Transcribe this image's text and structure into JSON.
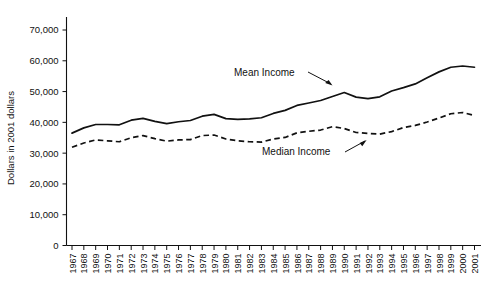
{
  "chart_data": {
    "type": "line",
    "title": "",
    "xlabel": "",
    "ylabel": "Dollars in 2001 dollars",
    "ylim": [
      0,
      75000
    ],
    "yticks": [
      0,
      10000,
      20000,
      30000,
      40000,
      50000,
      60000,
      70000
    ],
    "ytick_labels": [
      "0",
      "10,000",
      "20,000",
      "30,000",
      "40,000",
      "50,000",
      "60,000",
      "70,000"
    ],
    "grid": false,
    "legend_position": "inline-annotations",
    "categories": [
      "1967",
      "1968",
      "1969",
      "1970",
      "1971",
      "1972",
      "1973",
      "1974",
      "1975",
      "1976",
      "1977",
      "1978",
      "1979",
      "1980",
      "1981",
      "1982",
      "1983",
      "1984",
      "1985",
      "1986",
      "1987",
      "1988",
      "1989",
      "1990",
      "1991",
      "1992",
      "1993",
      "1994",
      "1995",
      "1996",
      "1997",
      "1998",
      "1999",
      "2000",
      "2001"
    ],
    "series": [
      {
        "name": "Mean Income",
        "style": "solid",
        "color": "#111111",
        "values": [
          36500,
          38200,
          39300,
          39300,
          39200,
          40700,
          41300,
          40300,
          39600,
          40200,
          40600,
          42000,
          42600,
          41200,
          41000,
          41100,
          41500,
          42900,
          43900,
          45500,
          46300,
          47100,
          48400,
          49700,
          48200,
          47700,
          48300,
          50200,
          51300,
          52500,
          54500,
          56400,
          57900,
          58300,
          57900
        ]
      },
      {
        "name": "Median Income",
        "style": "dashed",
        "color": "#111111",
        "values": [
          31900,
          33300,
          34300,
          34000,
          33700,
          35000,
          35700,
          34700,
          33900,
          34300,
          34400,
          35700,
          35900,
          34600,
          34000,
          33700,
          33600,
          34600,
          35100,
          36600,
          37100,
          37500,
          38600,
          38000,
          36700,
          36400,
          36200,
          37000,
          38300,
          39000,
          40100,
          41400,
          42800,
          43200,
          42200
        ]
      }
    ],
    "annotations": [
      {
        "text": "Mean Income",
        "series": "Mean Income"
      },
      {
        "text": "Median Income",
        "series": "Median Income"
      }
    ]
  },
  "axis": {
    "y_title": "Dollars in 2001 dollars"
  },
  "annotations": {
    "mean_label": "Mean Income",
    "median_label": "Median Income"
  }
}
